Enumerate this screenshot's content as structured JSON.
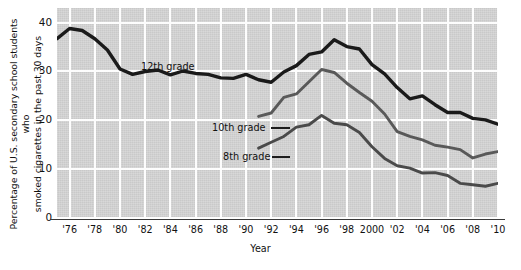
{
  "chart_data": {
    "type": "line",
    "title": "",
    "xlabel": "Year",
    "ylabel": "Percentage of U.S. secondary school students who smoked cigarettes in the past 30 days",
    "ylabel_line1": "Percentage of U.S. secondary school students who",
    "ylabel_line2": "smoked cigarettes in the past 30 days",
    "xlim": [
      1975,
      2010
    ],
    "ylim": [
      0,
      43
    ],
    "yticks": [
      0,
      10,
      20,
      30,
      40
    ],
    "ytick_labels": [
      "0",
      "10",
      "20",
      "30",
      "40"
    ],
    "xticks": [
      1976,
      1978,
      1980,
      1982,
      1984,
      1986,
      1988,
      1990,
      1992,
      1994,
      1996,
      1998,
      2000,
      2002,
      2004,
      2006,
      2008,
      2010
    ],
    "xtick_labels": [
      "'76",
      "'78",
      "'80",
      "'82",
      "'84",
      "'86",
      "'88",
      "'90",
      "'92",
      "'94",
      "'96",
      "'98",
      "2000",
      "'02",
      "'04",
      "'06",
      "'08",
      "'10"
    ],
    "grid": true,
    "grid_color": "#ffffff",
    "plot_background": "#d4d4d4",
    "legend": "inline-labels",
    "series": [
      {
        "name": "12th grade",
        "color": "#1a1a1a",
        "x": [
          1975,
          1976,
          1977,
          1978,
          1979,
          1980,
          1981,
          1982,
          1983,
          1984,
          1985,
          1986,
          1987,
          1988,
          1989,
          1990,
          1991,
          1992,
          1993,
          1994,
          1995,
          1996,
          1997,
          1998,
          1999,
          2000,
          2001,
          2002,
          2003,
          2004,
          2005,
          2006,
          2007,
          2008,
          2009,
          2010
        ],
        "values": [
          36.7,
          38.8,
          38.4,
          36.7,
          34.4,
          30.5,
          29.4,
          30.0,
          30.3,
          29.3,
          30.1,
          29.6,
          29.4,
          28.7,
          28.6,
          29.4,
          28.3,
          27.8,
          29.9,
          31.2,
          33.5,
          34.0,
          36.5,
          35.1,
          34.6,
          31.4,
          29.5,
          26.7,
          24.4,
          25.0,
          23.2,
          21.6,
          21.6,
          20.4,
          20.1,
          19.2
        ]
      },
      {
        "name": "10th grade",
        "color": "#595959",
        "x": [
          1991,
          1992,
          1993,
          1994,
          1995,
          1996,
          1997,
          1998,
          1999,
          2000,
          2001,
          2002,
          2003,
          2004,
          2005,
          2006,
          2007,
          2008,
          2009,
          2010
        ],
        "values": [
          20.8,
          21.5,
          24.7,
          25.4,
          27.9,
          30.4,
          29.8,
          27.6,
          25.7,
          23.9,
          21.3,
          17.7,
          16.7,
          16.0,
          14.9,
          14.5,
          14.0,
          12.3,
          13.1,
          13.6
        ]
      },
      {
        "name": "8th grade",
        "color": "#4a4a4a",
        "x": [
          1991,
          1992,
          1993,
          1994,
          1995,
          1996,
          1997,
          1998,
          1999,
          2000,
          2001,
          2002,
          2003,
          2004,
          2005,
          2006,
          2007,
          2008,
          2009,
          2010
        ],
        "values": [
          14.3,
          15.5,
          16.7,
          18.6,
          19.1,
          21.0,
          19.4,
          19.1,
          17.5,
          14.6,
          12.2,
          10.7,
          10.2,
          9.2,
          9.3,
          8.7,
          7.1,
          6.8,
          6.5,
          7.1
        ]
      }
    ],
    "annotations": [
      {
        "text": "12th grade",
        "series": "12th grade"
      },
      {
        "text": "10th grade",
        "series": "10th grade"
      },
      {
        "text": "8th grade",
        "series": "8th grade"
      }
    ]
  }
}
